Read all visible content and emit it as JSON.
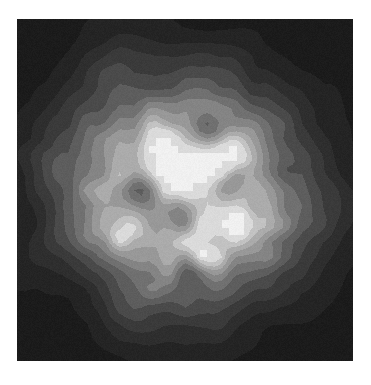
{
  "figure": {
    "kind": "filled-contour-map",
    "title": "",
    "subtitle": "",
    "caption": "",
    "width_px": 371,
    "height_px": 385,
    "background_color": "#ffffff",
    "plot_area": {
      "left_px": 17,
      "top_px": 19,
      "width_px": 336,
      "height_px": 342,
      "background_color": "#1d1d1d",
      "border": "none",
      "axes_visible": false,
      "tick_labels_visible": false,
      "axis_labels_visible": false,
      "legend_visible": false,
      "colorbar_visible": false
    }
  },
  "chart_data": {
    "type": "heatmap",
    "render_style": "filled-contour",
    "title": "",
    "subtitle": "",
    "xlabel": "",
    "ylabel": "",
    "xlim": [
      0,
      336
    ],
    "ylim": [
      0,
      342
    ],
    "xticks": [],
    "yticks": [],
    "xticklabels": [],
    "yticklabels": [],
    "grid": false,
    "legend": false,
    "legend_position": "none",
    "colormap": "gray",
    "colormap_reversed": false,
    "value_range": [
      0.0,
      1.0
    ],
    "annotations": [],
    "contour_levels": [
      0.0,
      0.09,
      0.18,
      0.27,
      0.37,
      0.47,
      0.57,
      0.66,
      0.74,
      0.82,
      0.89,
      0.95,
      1.0
    ],
    "level_colors": [
      "#1b1b1b",
      "#242424",
      "#2e2e2e",
      "#3a3a3a",
      "#4a4a4a",
      "#5d5d5d",
      "#707070",
      "#848484",
      "#989898",
      "#ababab",
      "#c2c2c2",
      "#dadada",
      "#f0f0f0"
    ],
    "source_field": {
      "description": "Roughly circular extended source: smooth radial falloff from a mottled bright core to a dark background, with a jagged polygonal contour outline caused by a coarse sampling grid.",
      "grid_nx": 46,
      "grid_ny": 46,
      "center_x_frac": 0.495,
      "center_y_frac": 0.505,
      "core_radius_frac": 0.215,
      "halo_radius_frac": 0.445,
      "edge_softness": 0.175,
      "ellipticity": 0.935,
      "position_angle_deg": 18,
      "background_level": 0.035,
      "background_noise_amp": 0.028,
      "core_noise_amp": 0.215,
      "core_noise_scale": 5.4,
      "fine_noise_amp": 0.105,
      "fine_noise_scale": 11.0,
      "ring_modulation_amp": 0.055,
      "ring_modulation_freq": 9.5,
      "random_seed": 20147
    },
    "peaks": [
      {
        "x_frac": 0.34,
        "y_frac": 0.62,
        "value": 1.0,
        "label": ""
      },
      {
        "x_frac": 0.46,
        "y_frac": 0.47,
        "value": 0.97,
        "label": ""
      },
      {
        "x_frac": 0.6,
        "y_frac": 0.4,
        "value": 0.94,
        "label": ""
      },
      {
        "x_frac": 0.55,
        "y_frac": 0.7,
        "value": 0.93,
        "label": ""
      },
      {
        "x_frac": 0.66,
        "y_frac": 0.58,
        "value": 0.9,
        "label": ""
      },
      {
        "x_frac": 0.4,
        "y_frac": 0.36,
        "value": 0.88,
        "label": ""
      }
    ],
    "depressions": [
      {
        "x_frac": 0.57,
        "y_frac": 0.33,
        "value": 0.58,
        "label": ""
      },
      {
        "x_frac": 0.48,
        "y_frac": 0.56,
        "value": 0.6,
        "label": ""
      },
      {
        "x_frac": 0.37,
        "y_frac": 0.5,
        "value": 0.62,
        "label": ""
      },
      {
        "x_frac": 0.63,
        "y_frac": 0.49,
        "value": 0.63,
        "label": ""
      },
      {
        "x_frac": 0.52,
        "y_frac": 0.74,
        "value": 0.61,
        "label": ""
      }
    ],
    "radial_profile": {
      "r_frac": [
        0.0,
        0.05,
        0.1,
        0.15,
        0.2,
        0.25,
        0.3,
        0.34,
        0.38,
        0.42,
        0.46,
        0.5,
        0.55,
        0.62,
        0.7,
        1.0
      ],
      "value": [
        0.93,
        0.92,
        0.9,
        0.87,
        0.82,
        0.74,
        0.63,
        0.52,
        0.42,
        0.32,
        0.22,
        0.14,
        0.08,
        0.05,
        0.04,
        0.03
      ]
    }
  }
}
